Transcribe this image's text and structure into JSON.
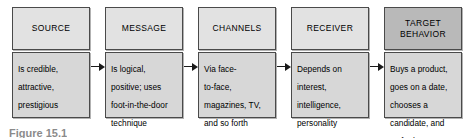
{
  "figure": {
    "type": "process-flow-diagram",
    "caption_fragment": "Figure 15.1",
    "colors": {
      "header_fill": "#e2e2e2",
      "header_fill_emphasis": "#b9b9b9",
      "body_fill": "#d7d7d7",
      "border": "#4a4a4a",
      "arrow": "#1a1a1a",
      "text": "#000000",
      "background": "#ffffff"
    },
    "stages": [
      {
        "id": "source",
        "header": "SOURCE",
        "body": "Is credible,\nattractive,\nprestigious",
        "emphasis": false
      },
      {
        "id": "message",
        "header": "MESSAGE",
        "body": "Is logical,\npositive; uses\nfoot-in-the-door\ntechnique",
        "emphasis": false
      },
      {
        "id": "channels",
        "header": "CHANNELS",
        "body": "Via face-\nto-face,\nmagazines, TV,\nand so forth",
        "emphasis": false
      },
      {
        "id": "receiver",
        "header": "RECEIVER",
        "body": "Depends on\ninterest,\nintelligence,\npersonality",
        "emphasis": false
      },
      {
        "id": "target-behavior",
        "header": "TARGET\nBEHAVIOR",
        "body": "Buys a product,\ngoes on a date,\nchooses a\ncandidate, and\nso forth",
        "emphasis": true
      }
    ],
    "connectors": [
      {
        "id": "source-to-message",
        "from": "source",
        "to": "message",
        "glyph": "arrow-right-icon"
      },
      {
        "id": "message-to-channels",
        "from": "message",
        "to": "channels",
        "glyph": "arrow-right-icon"
      },
      {
        "id": "channels-to-receiver",
        "from": "channels",
        "to": "receiver",
        "glyph": "arrow-right-icon"
      },
      {
        "id": "receiver-to-target-behavior",
        "from": "receiver",
        "to": "target-behavior",
        "glyph": "arrow-right-icon"
      }
    ]
  }
}
